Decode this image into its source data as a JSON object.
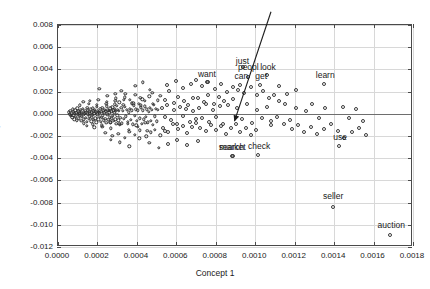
{
  "figure": {
    "background": "#ffffff",
    "frame_color": "#4a4a4a",
    "grid_color": "#d8d8d8",
    "point_color": "#3a3a3a"
  },
  "chart_data": {
    "type": "scatter",
    "title": "",
    "xlabel": "Concept 1",
    "ylabel": "Concept 2",
    "xlim": [
      0.0,
      0.0018
    ],
    "ylim": [
      -0.012,
      0.008
    ],
    "grid": true,
    "legend": null,
    "xticks": [
      "0.0000",
      "0.0002",
      "0.0004",
      "0.0006",
      "0.0008",
      "0.0010",
      "0.0012",
      "0.0014",
      "0.0016",
      "0.0018"
    ],
    "xtick_values": [
      0.0,
      0.0002,
      0.0004,
      0.0006,
      0.0008,
      0.001,
      0.0012,
      0.0014,
      0.0016,
      0.0018
    ],
    "yticks": [
      "0.008",
      "0.006",
      "0.004",
      "0.002",
      "0.000",
      "-0.002",
      "-0.004",
      "-0.006",
      "-0.008",
      "-0.010",
      "-0.012"
    ],
    "ytick_values": [
      0.008,
      0.006,
      0.004,
      0.002,
      0.0,
      -0.002,
      -0.004,
      -0.006,
      -0.008,
      -0.01,
      -0.012
    ],
    "zero_line_y": 0.0,
    "annotations": [
      {
        "text": "just",
        "x": 0.000935,
        "y": 0.0047,
        "point_x": 0.00094,
        "point_y": 0.0042
      },
      {
        "text": "peopl",
        "x": 0.000965,
        "y": 0.00412,
        "point_x": 0.000965,
        "point_y": 0.0033
      },
      {
        "text": "look",
        "x": 0.001065,
        "y": 0.00412,
        "point_x": 0.00106,
        "point_y": 0.0035
      },
      {
        "text": "want",
        "x": 0.000755,
        "y": 0.0035,
        "point_x": 0.000755,
        "point_y": 0.00285
      },
      {
        "text": "can",
        "x": 0.00093,
        "y": 0.0033,
        "point_x": 0.000925,
        "point_y": 0.00262
      },
      {
        "text": "get",
        "x": 0.00103,
        "y": 0.0033,
        "point_x": 0.001025,
        "point_y": 0.00262
      },
      {
        "text": "learn",
        "x": 0.001355,
        "y": 0.0034,
        "point_x": 0.00135,
        "point_y": 0.00272
      },
      {
        "text": "use",
        "x": 0.00143,
        "y": -0.00215,
        "point_x": 0.001425,
        "point_y": -0.00288
      },
      {
        "text": "check",
        "x": 0.00102,
        "y": -0.00295,
        "point_x": 0.001015,
        "point_y": -0.00375
      },
      {
        "text": "search",
        "x": 0.00088,
        "y": -0.0031,
        "point_x": 0.00088,
        "point_y": -0.0038
      },
      {
        "text": "market",
        "x": 0.000885,
        "y": -0.0031,
        "point_x": 0.000885,
        "point_y": -0.0038
      },
      {
        "text": "seller",
        "x": 0.001395,
        "y": -0.0075,
        "point_x": 0.001395,
        "point_y": -0.0084
      },
      {
        "text": "auction",
        "x": 0.00169,
        "y": -0.0101,
        "point_x": 0.001685,
        "point_y": -0.01095
      }
    ],
    "arrow": {
      "tail_x": 0.001085,
      "tail_y": 0.0091,
      "head_x": 0.0009,
      "head_y": -0.00075,
      "color": "#1a1a1a"
    },
    "points": [
      [
        5.5e-05,
        0.00012
      ],
      [
        6e-05,
        -4e-05
      ],
      [
        6.3e-05,
        0.00025
      ],
      [
        6.6e-05,
        -0.0002
      ],
      [
        7e-05,
        5e-05
      ],
      [
        7.2e-05,
        -0.00033
      ],
      [
        7.5e-05,
        0.00041
      ],
      [
        7.8e-05,
        -0.00012
      ],
      [
        8e-05,
        0.00018
      ],
      [
        8.2e-05,
        -0.00048
      ],
      [
        8.5e-05,
        2e-05
      ],
      [
        8.8e-05,
        0.0003
      ],
      [
        9e-05,
        -0.00026
      ],
      [
        9.2e-05,
        9e-05
      ],
      [
        9.5e-05,
        -0.00058
      ],
      [
        9.8e-05,
        0.00051
      ],
      [
        0.0001,
        -7e-05
      ],
      [
        0.000102,
        0.00022
      ],
      [
        0.000105,
        -0.00039
      ],
      [
        0.000108,
        0.00014
      ],
      [
        0.00011,
        3e-05
      ],
      [
        0.000112,
        -0.00017
      ],
      [
        0.000115,
        0.00036
      ],
      [
        0.000118,
        -0.00062
      ],
      [
        0.00012,
        8e-05
      ],
      [
        0.000122,
        -0.00029
      ],
      [
        0.000125,
        0.00044
      ],
      [
        0.000128,
        -9e-05
      ],
      [
        0.00013,
        0.00019
      ],
      [
        0.000132,
        -0.00051
      ],
      [
        0.000135,
        1e-05
      ],
      [
        0.000138,
        0.00027
      ],
      [
        0.00014,
        -0.00036
      ],
      [
        0.000142,
        0.00011
      ],
      [
        0.000145,
        -0.0007
      ],
      [
        0.000148,
        0.00056
      ],
      [
        0.00015,
        -3e-05
      ],
      [
        0.000152,
        0.00032
      ],
      [
        0.000155,
        -0.00044
      ],
      [
        0.000158,
        0.00016
      ],
      [
        0.00016,
        6e-05
      ],
      [
        0.000162,
        -0.00023
      ],
      [
        0.000165,
        0.0004
      ],
      [
        0.000168,
        -0.00066
      ],
      [
        0.00017,
        0.00013
      ],
      [
        0.000172,
        -0.00031
      ],
      [
        0.000175,
        0.00048
      ],
      [
        0.000178,
        -0.00011
      ],
      [
        0.00018,
        0.00024
      ],
      [
        0.000182,
        -0.00055
      ],
      [
        0.000185,
        4e-05
      ],
      [
        0.000188,
        0.00034
      ],
      [
        0.00019,
        -0.00041
      ],
      [
        0.000192,
        0.00015
      ],
      [
        0.000195,
        -0.00075
      ],
      [
        0.000198,
        0.00061
      ],
      [
        0.0002,
        -6e-05
      ],
      [
        0.000202,
        0.00029
      ],
      [
        0.000205,
        -0.00049
      ],
      [
        0.000208,
        0.0002
      ],
      [
        0.00021,
        0.0001
      ],
      [
        0.000213,
        -0.00027
      ],
      [
        0.000215,
        0.00045
      ],
      [
        0.000218,
        -0.00072
      ],
      [
        0.00022,
        0.00017
      ],
      [
        0.000223,
        -0.00035
      ],
      [
        0.000225,
        0.00053
      ],
      [
        0.000228,
        -0.00014
      ],
      [
        0.00023,
        0.00028
      ],
      [
        0.000233,
        -0.0006
      ],
      [
        0.000235,
        7e-05
      ],
      [
        0.000238,
        0.00038
      ],
      [
        0.00024,
        -0.00046
      ],
      [
        0.000243,
        0.00021
      ],
      [
        0.000245,
        -0.00082
      ],
      [
        0.000248,
        0.00066
      ],
      [
        0.00025,
        -0.0001
      ],
      [
        0.000253,
        0.00033
      ],
      [
        0.000255,
        -0.00054
      ],
      [
        0.000258,
        0.00025
      ],
      [
        0.00026,
        0.00013
      ],
      [
        0.000263,
        -0.00032
      ],
      [
        0.000265,
        0.0005
      ],
      [
        0.000268,
        -0.00078
      ],
      [
        0.00027,
        0.00022
      ],
      [
        0.000273,
        -0.0004
      ],
      [
        0.000275,
        0.00058
      ],
      [
        0.000278,
        -0.00018
      ],
      [
        0.00028,
        0.00031
      ],
      [
        0.000283,
        -0.00065
      ],
      [
        0.000285,
        0.0001
      ],
      [
        0.000288,
        0.00042
      ],
      [
        0.00029,
        -0.00051
      ],
      [
        0.000293,
        0.00026
      ],
      [
        0.000295,
        -0.00088
      ],
      [
        0.000298,
        0.00071
      ],
      [
        0.0003,
        -0.00013
      ],
      [
        0.000303,
        0.00036
      ],
      [
        0.000305,
        -0.00059
      ],
      [
        0.000308,
        0.00029
      ],
      [
        0.00031,
        0.00102
      ],
      [
        0.000315,
        -0.00036
      ],
      [
        0.00032,
        0.00055
      ],
      [
        0.000325,
        -0.00084
      ],
      [
        0.00033,
        0.00026
      ],
      [
        0.000335,
        -0.00045
      ],
      [
        0.00034,
        0.00063
      ],
      [
        0.000345,
        -0.00022
      ],
      [
        0.00035,
        0.00035
      ],
      [
        0.000355,
        -0.0007
      ],
      [
        0.00036,
        0.00014
      ],
      [
        0.000365,
        0.00047
      ],
      [
        0.00037,
        -0.00056
      ],
      [
        0.000375,
        0.0003
      ],
      [
        0.00038,
        -0.00093
      ],
      [
        0.000385,
        0.00076
      ],
      [
        0.00039,
        -0.00017
      ],
      [
        0.000395,
        0.0004
      ],
      [
        0.0004,
        -0.00064
      ],
      [
        0.000405,
        0.00033
      ],
      [
        0.00041,
        0.00088
      ],
      [
        0.000415,
        -0.00041
      ],
      [
        0.00042,
        0.0006
      ],
      [
        0.000425,
        -0.00089
      ],
      [
        0.00043,
        0.00031
      ],
      [
        0.000435,
        -0.0005
      ],
      [
        0.00044,
        0.00068
      ],
      [
        0.000445,
        -0.00027
      ],
      [
        0.00045,
        0.0004
      ],
      [
        0.000455,
        -0.00075
      ],
      [
        0.00046,
        0.00019
      ],
      [
        0.000465,
        0.00052
      ],
      [
        0.00047,
        -0.00061
      ],
      [
        0.000475,
        0.00035
      ],
      [
        0.00048,
        -0.00098
      ],
      [
        0.000485,
        0.00081
      ],
      [
        0.00049,
        -0.00022
      ],
      [
        0.000495,
        0.00045
      ],
      [
        0.0005,
        -0.00069
      ],
      [
        0.000505,
        0.00038
      ],
      [
        0.000128,
        0.0011
      ],
      [
        0.000145,
        -0.00108
      ],
      [
        0.000162,
        0.00118
      ],
      [
        0.000185,
        -0.00122
      ],
      [
        0.000205,
        0.00125
      ],
      [
        0.000225,
        -0.00115
      ],
      [
        0.000248,
        0.00108
      ],
      [
        0.000268,
        -0.00132
      ],
      [
        0.00029,
        0.00115
      ],
      [
        0.000312,
        -0.00098
      ],
      [
        0.000335,
        0.00128
      ],
      [
        0.000358,
        -0.00142
      ],
      [
        0.000382,
        0.00096
      ],
      [
        0.000405,
        -0.00118
      ],
      [
        0.000428,
        0.00132
      ],
      [
        0.000452,
        -0.00155
      ],
      [
        0.00011,
        0.00078
      ],
      [
        0.000132,
        -0.00085
      ],
      [
        0.000155,
        0.00092
      ],
      [
        0.000178,
        -0.00095
      ],
      [
        0.000198,
        0.00082
      ],
      [
        0.000222,
        -0.00102
      ],
      [
        0.000245,
        0.0009
      ],
      [
        0.000265,
        -0.00078
      ],
      [
        0.000288,
        0.00086
      ],
      [
        0.00031,
        -0.00092
      ],
      [
        0.000332,
        0.0008
      ],
      [
        0.000355,
        -0.00088
      ],
      [
        0.000375,
        0.00094
      ],
      [
        0.000398,
        -0.00105
      ],
      [
        0.00042,
        0.00076
      ],
      [
        0.000442,
        -0.00082
      ],
      [
        0.00021,
        0.00225
      ],
      [
        0.00025,
        0.0016
      ],
      [
        0.00029,
        0.0018
      ],
      [
        0.00032,
        0.00205
      ],
      [
        0.000338,
        0.00148
      ],
      [
        0.000365,
        0.00128
      ],
      [
        0.000392,
        0.00172
      ],
      [
        0.000418,
        0.00142
      ],
      [
        0.00044,
        0.00118
      ],
      [
        0.000462,
        0.00158
      ],
      [
        0.00048,
        0.00088
      ],
      [
        0.000505,
        0.00122
      ],
      [
        0.00024,
        -0.0017
      ],
      [
        0.000275,
        -0.00198
      ],
      [
        0.000305,
        -0.00178
      ],
      [
        0.00034,
        -0.00215
      ],
      [
        0.000362,
        -0.00162
      ],
      [
        0.00039,
        -0.00188
      ],
      [
        0.000415,
        -0.00148
      ],
      [
        0.000448,
        -0.00202
      ],
      [
        0.00047,
        -0.00168
      ],
      [
        0.000492,
        -0.00142
      ],
      [
        0.000518,
        -0.00192
      ],
      [
        0.00054,
        -0.00158
      ],
      [
        0.000525,
        0.0005
      ],
      [
        0.00054,
        -0.00032
      ],
      [
        0.000555,
        0.00078
      ],
      [
        0.000572,
        -0.0006
      ],
      [
        0.000588,
        0.00035
      ],
      [
        0.000602,
        -0.00088
      ],
      [
        0.000618,
        0.00062
      ],
      [
        0.000635,
        -0.00022
      ],
      [
        0.00065,
        0.00042
      ],
      [
        0.000668,
        -0.0007
      ],
      [
        0.000685,
        0.00028
      ],
      [
        0.0007,
        -0.00048
      ],
      [
        0.000518,
        0.00162
      ],
      [
        0.000545,
        0.00128
      ],
      [
        0.000562,
        0.00205
      ],
      [
        0.00059,
        0.00098
      ],
      [
        0.00061,
        0.00155
      ],
      [
        0.000638,
        0.00118
      ],
      [
        0.000658,
        0.00082
      ],
      [
        0.000682,
        0.00138
      ],
      [
        0.00053,
        -0.00128
      ],
      [
        0.000558,
        -0.00165
      ],
      [
        0.000582,
        -0.00095
      ],
      [
        0.000608,
        -0.00138
      ],
      [
        0.000632,
        -0.00108
      ],
      [
        0.000655,
        -0.00172
      ],
      [
        0.000678,
        -0.00118
      ],
      [
        0.000702,
        -0.00085
      ],
      [
        0.00043,
        0.00282
      ],
      [
        0.000465,
        0.00215
      ],
      [
        0.000392,
        0.00252
      ],
      [
        0.000478,
        0.00188
      ],
      [
        0.000715,
        0.00055
      ],
      [
        0.000732,
        -0.00042
      ],
      [
        0.00075,
        0.00088
      ],
      [
        0.000768,
        -0.00072
      ],
      [
        0.000785,
        0.00038
      ],
      [
        0.000802,
        -0.00028
      ],
      [
        0.00082,
        0.00068
      ],
      [
        0.000838,
        -0.00095
      ],
      [
        0.000712,
        0.00138
      ],
      [
        0.000738,
        0.00108
      ],
      [
        0.000762,
        0.00172
      ],
      [
        0.00079,
        0.00092
      ],
      [
        0.000815,
        0.00148
      ],
      [
        0.00084,
        0.00118
      ],
      [
        0.000862,
        0.00078
      ],
      [
        0.000888,
        0.00132
      ],
      [
        0.000722,
        -0.00125
      ],
      [
        0.000748,
        -0.00158
      ],
      [
        0.000775,
        -0.00098
      ],
      [
        0.0008,
        -0.00142
      ],
      [
        0.000828,
        -0.00112
      ],
      [
        0.000852,
        -0.00178
      ],
      [
        0.000878,
        -0.00128
      ],
      [
        0.000902,
        -0.00088
      ],
      [
        0.000555,
        0.00262
      ],
      [
        0.000598,
        0.00292
      ],
      [
        0.000632,
        0.00232
      ],
      [
        0.000672,
        0.00268
      ],
      [
        0.0007,
        0.00305
      ],
      [
        0.00073,
        0.00252
      ],
      [
        0.000762,
        0.00288
      ],
      [
        0.000795,
        0.00222
      ],
      [
        0.000825,
        0.00265
      ],
      [
        0.000855,
        0.00195
      ],
      [
        0.000885,
        0.00245
      ],
      [
        0.000915,
        0.00212
      ],
      [
        0.000945,
        0.00185
      ],
      [
        0.000978,
        0.00238
      ],
      [
        0.001008,
        0.00168
      ],
      [
        0.001038,
        0.00205
      ],
      [
        0.00091,
        0.00048
      ],
      [
        0.000935,
        -0.00048
      ],
      [
        0.000958,
        0.00085
      ],
      [
        0.000982,
        -0.00082
      ],
      [
        0.001008,
        0.00032
      ],
      [
        0.001032,
        -0.00038
      ],
      [
        0.001058,
        0.00062
      ],
      [
        0.001082,
        -0.00105
      ],
      [
        0.000925,
        -0.00168
      ],
      [
        0.000952,
        -0.00132
      ],
      [
        0.000978,
        -0.00195
      ],
      [
        0.001005,
        -0.00148
      ],
      [
        0.001068,
        0.00142
      ],
      [
        0.001095,
        0.00172
      ],
      [
        0.001122,
        0.00118
      ],
      [
        0.001152,
        0.00088
      ],
      [
        0.001082,
        -0.00062
      ],
      [
        0.001112,
        -0.00032
      ],
      [
        0.001145,
        -0.00092
      ],
      [
        0.001178,
        -0.00052
      ],
      [
        0.00112,
        0.00248
      ],
      [
        0.001162,
        0.00175
      ],
      [
        0.001205,
        0.00212
      ],
      [
        0.001208,
        0.00052
      ],
      [
        0.001185,
        -0.00138
      ],
      [
        0.001215,
        -0.00098
      ],
      [
        0.001248,
        -0.00165
      ],
      [
        0.001282,
        -0.00118
      ],
      [
        0.001258,
        0.00025
      ],
      [
        0.00129,
        0.00092
      ],
      [
        0.001322,
        -0.00042
      ],
      [
        0.001355,
        0.00055
      ],
      [
        0.001312,
        -0.00182
      ],
      [
        0.001348,
        -0.00138
      ],
      [
        0.001382,
        -0.00088
      ],
      [
        0.001418,
        -0.00158
      ],
      [
        0.001445,
        0.00062
      ],
      [
        0.001478,
        -0.00035
      ],
      [
        0.001512,
        0.00042
      ],
      [
        0.001548,
        -0.00068
      ],
      [
        0.001452,
        -0.00215
      ],
      [
        0.00149,
        -0.00168
      ],
      [
        0.001525,
        -0.00125
      ],
      [
        0.001562,
        -0.00192
      ],
      [
        0.00056,
        -0.00268
      ],
      [
        0.000605,
        -0.00232
      ],
      [
        0.000655,
        -0.00285
      ],
      [
        0.000708,
        -0.00245
      ],
      [
        0.000312,
        -0.00258
      ],
      [
        0.000362,
        -0.00292
      ],
      [
        0.000412,
        -0.00222
      ],
      [
        0.000268,
        -0.00232
      ],
      [
        0.000462,
        -0.00262
      ],
      [
        0.000512,
        -0.00305
      ],
      [
        0.000342,
        0.00178
      ],
      [
        0.000292,
        0.00138
      ]
    ]
  }
}
